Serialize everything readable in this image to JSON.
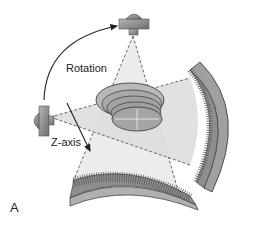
{
  "figure": {
    "panel_label": "A",
    "labels": {
      "rotation": "Rotation",
      "z_axis": "Z-axis"
    },
    "components": [
      "x-ray-tube-top",
      "x-ray-tube-left",
      "fan-beam-top",
      "fan-beam-left",
      "patient-cylinder-slices",
      "detector-arc-right",
      "detector-arc-bottom",
      "rotation-arrow",
      "z-axis-arrow"
    ],
    "colors": {
      "background": "#ffffff",
      "beam_fill": "#e9e9e9",
      "beam_fill_dark": "#cfcfcf",
      "tube": "#8a8a8a",
      "cylinder": "#a8a8a8",
      "detector": "#9a9a9a",
      "line": "#333333"
    }
  }
}
